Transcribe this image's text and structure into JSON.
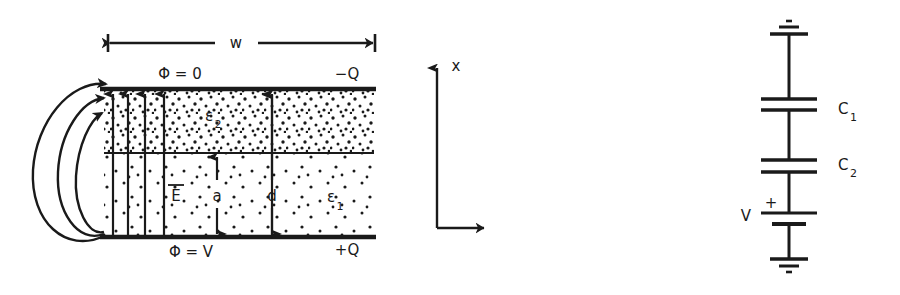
{
  "figure": {
    "title_alt": "Parallel-plate capacitor with two dielectric layers and its equivalent series-capacitor circuit",
    "ink_color": "#1a1a1a",
    "background_color": "#ffffff"
  },
  "capacitor_diagram": {
    "width_dimension_label": "w",
    "top_plate": {
      "potential_label": "Φ  =  0",
      "charge_label": "−Q"
    },
    "bottom_plate": {
      "potential_label": "Φ  =  V",
      "charge_label": "+Q"
    },
    "dielectrics": [
      {
        "name": "upper-layer",
        "label": "ε",
        "subscript": "2"
      },
      {
        "name": "lower-layer",
        "label": "ε",
        "subscript": "1"
      }
    ],
    "field_label": "E",
    "dimension_a_label": "a",
    "dimension_d_label": "d"
  },
  "axes": {
    "vertical_label": "x"
  },
  "circuit_diagram": {
    "capacitors": [
      {
        "label": "C",
        "subscript": "1"
      },
      {
        "label": "C",
        "subscript": "2"
      }
    ],
    "source_label": "V",
    "polarity_label": "+",
    "ground_symbol_name": "ground-symbol"
  }
}
